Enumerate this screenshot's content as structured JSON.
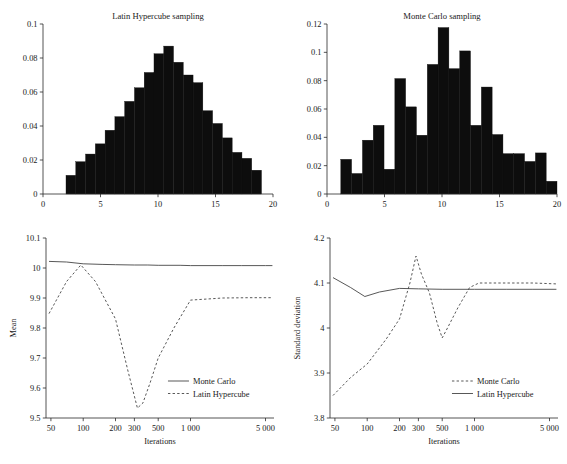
{
  "figure": {
    "width": 567,
    "height": 464,
    "background": "#ffffff",
    "ink": "#1a1a1a"
  },
  "watermark": {
    "text": ""
  },
  "chart_data": [
    {
      "id": "latin-hypercube-histogram",
      "type": "bar",
      "title": "Latin Hypercube sampling",
      "xlabel": "",
      "ylabel": "",
      "xlim": [
        0,
        20
      ],
      "ylim": [
        0,
        0.1
      ],
      "xticks": [
        0,
        5,
        10,
        15,
        20
      ],
      "xticklabels": [
        "0",
        "5",
        "10",
        "15",
        "20"
      ],
      "yticks": [
        0,
        0.02,
        0.04,
        0.06,
        0.08,
        0.1
      ],
      "yticklabels": [
        "0",
        "0.02",
        "0.04",
        "0.06",
        "0.08",
        "0.1"
      ],
      "grid": false,
      "bar_color": "#0d0d0d",
      "bin_edges": [
        2.0,
        2.85,
        3.7,
        4.55,
        5.4,
        6.25,
        7.1,
        7.95,
        8.8,
        9.65,
        10.5,
        11.35,
        12.2,
        13.05,
        13.9,
        14.75,
        15.6,
        16.45,
        17.3,
        18.15,
        19.0
      ],
      "categories": [
        "2.0-2.9",
        "2.9-3.7",
        "3.7-4.6",
        "4.6-5.4",
        "5.4-6.3",
        "6.3-7.1",
        "7.1-8.0",
        "8.0-8.8",
        "8.8-9.7",
        "9.7-10.5",
        "10.5-11.4",
        "11.4-12.2",
        "12.2-13.1",
        "13.1-13.9",
        "13.9-14.8",
        "14.8-15.6",
        "15.6-16.5",
        "16.5-17.3",
        "17.3-18.2",
        "18.2-19.0"
      ],
      "values": [
        0.011,
        0.019,
        0.0235,
        0.0295,
        0.0375,
        0.0455,
        0.0545,
        0.0625,
        0.0715,
        0.0825,
        0.087,
        0.0775,
        0.07,
        0.0655,
        0.049,
        0.0415,
        0.033,
        0.0245,
        0.021,
        0.014
      ]
    },
    {
      "id": "monte-carlo-histogram",
      "type": "bar",
      "title": "Monte Carlo sampling",
      "xlabel": "",
      "ylabel": "",
      "xlim": [
        0,
        20
      ],
      "ylim": [
        0,
        0.12
      ],
      "xticks": [
        0,
        5,
        10,
        15,
        20
      ],
      "xticklabels": [
        "0",
        "5",
        "10",
        "15",
        "20"
      ],
      "yticks": [
        0,
        0.02,
        0.04,
        0.06,
        0.08,
        0.1,
        0.12
      ],
      "yticklabels": [
        "0",
        "0.02",
        "0.04",
        "0.06",
        "0.08",
        "0.1",
        "0.12"
      ],
      "grid": false,
      "bar_color": "#0d0d0d",
      "bin_edges": [
        1.2,
        2.14,
        3.08,
        4.02,
        4.96,
        5.9,
        6.84,
        7.78,
        8.72,
        9.66,
        10.6,
        11.54,
        12.48,
        13.42,
        14.36,
        15.3,
        16.24,
        17.18,
        18.12,
        19.06,
        20.0
      ],
      "categories": [
        "1.2-2.1",
        "2.1-3.1",
        "3.1-4.0",
        "4.0-5.0",
        "5.0-5.9",
        "5.9-6.8",
        "6.8-7.8",
        "7.8-8.7",
        "8.7-9.7",
        "9.7-10.6",
        "10.6-11.5",
        "11.5-12.5",
        "12.5-13.4",
        "13.4-14.4",
        "14.4-15.3",
        "15.3-16.2",
        "16.2-17.2",
        "17.2-18.1",
        "18.1-19.1",
        "19.1-20.0"
      ],
      "values": [
        0.0245,
        0.0145,
        0.038,
        0.0485,
        0.0175,
        0.0815,
        0.0615,
        0.0415,
        0.0915,
        0.1175,
        0.0885,
        0.101,
        0.0485,
        0.0755,
        0.042,
        0.0285,
        0.0285,
        0.023,
        0.029,
        0.009
      ]
    },
    {
      "id": "mean-convergence",
      "type": "line",
      "title": "",
      "xlabel": "Iterations",
      "ylabel": "Mean",
      "xscale": "log",
      "xlim": [
        45,
        6000
      ],
      "ylim": [
        9.5,
        10.1
      ],
      "xticks": [
        50,
        100,
        200,
        300,
        500,
        1000,
        5000
      ],
      "xticklabels": [
        "50",
        "100",
        "200",
        "300",
        "500",
        "1 000",
        "5 000"
      ],
      "yticks": [
        9.5,
        9.6,
        9.7,
        9.8,
        9.9,
        10.0,
        10.1
      ],
      "yticklabels": [
        "9.5",
        "9.6",
        "9.7",
        "9.8",
        "9.9",
        "10",
        "10.1"
      ],
      "grid": false,
      "legend_position": "center-right",
      "series": [
        {
          "name": "Monte Carlo",
          "style": "solid",
          "color": "#3a3a3a",
          "x": [
            48,
            70,
            100,
            150,
            200,
            300,
            400,
            500,
            800,
            1000,
            2000,
            3000,
            5000,
            5800
          ],
          "values": [
            10.022,
            10.02,
            10.014,
            10.012,
            10.011,
            10.01,
            10.01,
            10.009,
            10.009,
            10.008,
            10.008,
            10.008,
            10.008,
            10.008
          ]
        },
        {
          "name": "Latin Hypercube",
          "style": "dashed",
          "color": "#3a3a3a",
          "x": [
            48,
            70,
            95,
            130,
            200,
            260,
            320,
            360,
            420,
            500,
            700,
            1000,
            2000,
            3500,
            5800
          ],
          "values": [
            9.848,
            9.955,
            10.01,
            9.955,
            9.83,
            9.66,
            9.533,
            9.55,
            9.617,
            9.7,
            9.8,
            9.893,
            9.9,
            9.901,
            9.901
          ]
        }
      ]
    },
    {
      "id": "standard-deviation-convergence",
      "type": "line",
      "title": "",
      "xlabel": "Iterations",
      "ylabel": "Standard deviation",
      "xscale": "log",
      "xlim": [
        45,
        6000
      ],
      "ylim": [
        3.8,
        4.2
      ],
      "xticks": [
        50,
        100,
        200,
        300,
        500,
        1000,
        5000
      ],
      "xticklabels": [
        "50",
        "100",
        "200",
        "300",
        "500",
        "1 000",
        "5 000"
      ],
      "yticks": [
        3.8,
        3.9,
        4.0,
        4.1,
        4.2
      ],
      "yticklabels": [
        "3.8",
        "3.9",
        "4",
        "4.1",
        "4.2"
      ],
      "grid": false,
      "legend_position": "center-right",
      "series": [
        {
          "name": "Monte Carlo",
          "style": "dashed",
          "color": "#3a3a3a",
          "x": [
            48,
            70,
            100,
            150,
            200,
            250,
            285,
            320,
            380,
            450,
            500,
            560,
            700,
            900,
            1100,
            2000,
            3500,
            5800
          ],
          "values": [
            3.85,
            3.89,
            3.92,
            3.975,
            4.02,
            4.1,
            4.16,
            4.12,
            4.078,
            4.01,
            3.978,
            4.0,
            4.045,
            4.09,
            4.1,
            4.1,
            4.1,
            4.098
          ]
        },
        {
          "name": "Latin Hypercube",
          "style": "solid",
          "color": "#3a3a3a",
          "x": [
            48,
            70,
            95,
            130,
            200,
            300,
            500,
            1000,
            2000,
            3500,
            5800
          ],
          "values": [
            4.112,
            4.09,
            4.07,
            4.08,
            4.088,
            4.087,
            4.086,
            4.086,
            4.086,
            4.086,
            4.086
          ]
        }
      ]
    }
  ]
}
